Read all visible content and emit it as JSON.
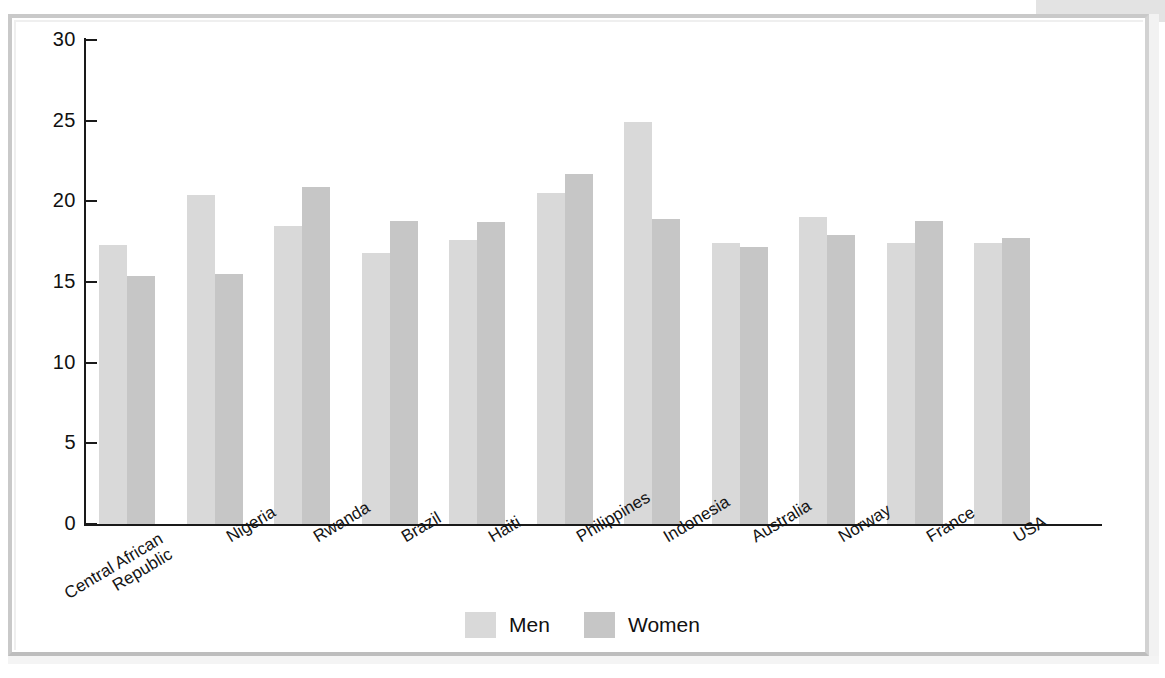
{
  "chart_data": {
    "type": "bar",
    "title": "",
    "subtitle": "",
    "xlabel": "",
    "ylabel": "",
    "ylim": [
      0,
      30
    ],
    "yticks": [
      0,
      5,
      10,
      15,
      20,
      25,
      30
    ],
    "ytick_labels": [
      "0",
      "5",
      "10",
      "15",
      "20",
      "25",
      "30"
    ],
    "grid": false,
    "legend_position": "bottom-center",
    "categories": [
      "Central African\nRepublic",
      "Nigeria",
      "Rwanda",
      "Brazil",
      "Haiti",
      "Philippines",
      "Indonesia",
      "Australia",
      "Norway",
      "France",
      "USA"
    ],
    "category_labels": [
      "Central African Republic",
      "Nigeria",
      "Rwanda",
      "Brazil",
      "Haiti",
      "Philippines",
      "Indonesia",
      "Australia",
      "Norway",
      "France",
      "USA"
    ],
    "series": [
      {
        "name": "Men",
        "color": "#d9d9d9",
        "values": [
          17.3,
          20.4,
          18.5,
          16.8,
          17.6,
          20.5,
          24.9,
          17.4,
          19.0,
          17.4,
          17.4
        ]
      },
      {
        "name": "Women",
        "color": "#c6c6c6",
        "values": [
          15.4,
          15.5,
          20.9,
          18.8,
          18.7,
          21.7,
          18.9,
          17.2,
          17.9,
          18.8,
          17.7
        ]
      }
    ]
  },
  "legend": {
    "items": [
      {
        "label": "Men",
        "color": "#d9d9d9"
      },
      {
        "label": "Women",
        "color": "#c6c6c6"
      }
    ]
  },
  "axis": {
    "axis_color": "#1a1a1a"
  }
}
